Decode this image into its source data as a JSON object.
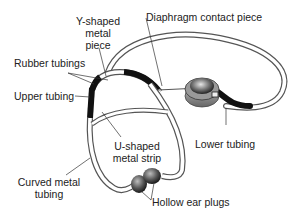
{
  "diagram": {
    "labels": {
      "y_shaped_line1": "Y-shaped",
      "y_shaped_line2": "metal",
      "y_shaped_line3": "piece",
      "diaphragm": "Diaphragm contact piece",
      "rubber_tubings": "Rubber tubings",
      "upper_tubing": "Upper tubing",
      "lower_tubing": "Lower tubing",
      "u_shaped_line1": "U-shaped",
      "u_shaped_line2": "metal strip",
      "curved_line1": "Curved metal",
      "curved_line2": "tubing",
      "ear_plugs": "Hollow ear plugs"
    },
    "colors": {
      "tube_outline": "#555555",
      "rubber": "#111111",
      "chestpiece": "#7a7a7a",
      "earplug": "#4a4a4a"
    }
  }
}
